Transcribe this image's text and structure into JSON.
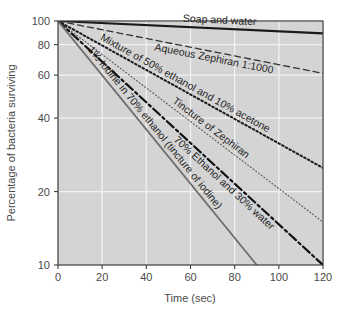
{
  "chart_data": {
    "type": "line",
    "title": "",
    "xlabel": "Time (sec)",
    "ylabel": "Percentage of bacteria surviving",
    "xlim": [
      0,
      120
    ],
    "ylim": [
      10,
      100
    ],
    "yscale": "log",
    "grid": true,
    "legend_position": "inline-along-curves",
    "xticks": [
      0,
      20,
      40,
      60,
      80,
      100,
      120
    ],
    "xtick_labels": [
      "0",
      "20",
      "40",
      "60",
      "80",
      "100",
      "120"
    ],
    "yticks": [
      10,
      20,
      40,
      60,
      80,
      100
    ],
    "ytick_labels": [
      "10",
      "20",
      "40",
      "60",
      "80",
      "100"
    ],
    "x": [
      0,
      120
    ],
    "series": [
      {
        "name": "Soap and water",
        "label": "Soap and water",
        "style": "solid",
        "color": "#1a1a1a",
        "width": 2.1,
        "values": [
          100,
          89
        ]
      },
      {
        "name": "Aqueous Zephiran 1:1000",
        "label": "Aqueous Zephiran 1:1000",
        "style": "dashed",
        "color": "#333333",
        "width": 1.3,
        "values": [
          100,
          61
        ]
      },
      {
        "name": "Mixture of 50% ethanol and 10% acetone",
        "label": "Mixture of 50% ethanol and 10% acetone",
        "style": "dotted",
        "color": "#1a1a1a",
        "width": 2.0,
        "values": [
          100,
          25
        ]
      },
      {
        "name": "Tincture of Zephiran",
        "label": "Tincture of Zephiran",
        "style": "fine-dotted",
        "color": "#555555",
        "width": 1.1,
        "values": [
          100,
          15
        ]
      },
      {
        "name": "70% Ethanol and 30% water",
        "label": "70% Ethanol and 30% water",
        "style": "dash-dot",
        "color": "#111111",
        "width": 2.2,
        "values": [
          100,
          10
        ]
      },
      {
        "name": "1% Iodine in 70% ethanol (tincture of iodine)",
        "label": "1% Iodine in 70% ethanol (tincture of iodine)",
        "style": "solid",
        "color": "#6e6e6e",
        "width": 1.8,
        "x_end": 90,
        "values": [
          100,
          10
        ]
      }
    ],
    "colors": {
      "plot_background": "#d4d4d4",
      "gridline": "#f2f2f2",
      "axis": "#3d3d3d",
      "page_background": "#ffffff",
      "tick_label": "#4a4a4a"
    }
  }
}
